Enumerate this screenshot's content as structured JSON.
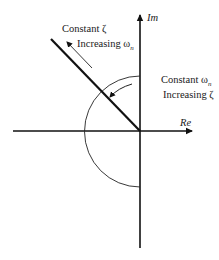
{
  "diagram": {
    "axes": {
      "imag_label": "Im",
      "real_label": "Re"
    },
    "annotations": {
      "constant_zeta": {
        "line1": "Constant ζ",
        "line2_prefix": "Increasing ω",
        "line2_sub": "n"
      },
      "constant_omega": {
        "line1_prefix": "Constant ω",
        "line1_sub": "n",
        "line2": "Increasing ζ"
      }
    },
    "colors": {
      "stroke": "#111111",
      "background": "#ffffff"
    }
  }
}
